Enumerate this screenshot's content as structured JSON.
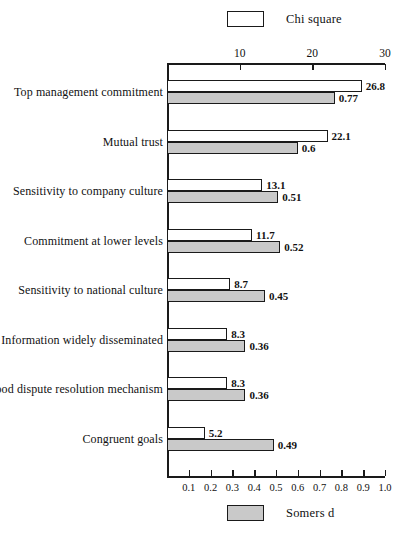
{
  "legend": {
    "top": {
      "label": "Chi square",
      "swatch": "white",
      "color": "#ffffff"
    },
    "bottom": {
      "label": "Somers d",
      "swatch": "gray",
      "color": "#c9c9c9"
    }
  },
  "axes": {
    "top": {
      "name": "Chi square",
      "ticks": [
        "10",
        "20",
        "30"
      ],
      "min": 0,
      "max": 30
    },
    "bottom": {
      "name": "Somers d",
      "ticks": [
        "0.1",
        "0.2",
        "0.3",
        "0.4",
        "0.5",
        "0.6",
        "0.7",
        "0.8",
        "0.9",
        "1.0"
      ],
      "min": 0,
      "max": 1.0
    }
  },
  "chart_data": {
    "type": "bar",
    "title": "",
    "orientation": "horizontal",
    "grid": false,
    "legend_position": "top and bottom center",
    "xlabel": "",
    "ylabel": "",
    "categories": [
      "Top management commitment",
      "Mutual trust",
      "Sensitivity to company culture",
      "Commitment at lower levels",
      "Sensitivity to national culture",
      "Information widely disseminated",
      "Good dispute resolution mechanism",
      "Congruent goals"
    ],
    "series": [
      {
        "name": "Chi square",
        "axis": "top",
        "color": "#ffffff",
        "xlim": [
          0,
          30
        ],
        "values": [
          26.8,
          22.1,
          13.1,
          11.7,
          8.7,
          8.3,
          8.3,
          5.2
        ],
        "labels": [
          "26.8",
          "22.1",
          "13.1",
          "11.7",
          "8.7",
          "8.3",
          "8.3",
          "5.2"
        ]
      },
      {
        "name": "Somers d",
        "axis": "bottom",
        "color": "#c9c9c9",
        "xlim": [
          0,
          1.0
        ],
        "values": [
          0.77,
          0.6,
          0.51,
          0.52,
          0.45,
          0.36,
          0.36,
          0.49
        ],
        "labels": [
          "0.77",
          "0.6",
          "0.51",
          "0.52",
          "0.45",
          "0.36",
          "0.36",
          "0.49"
        ]
      }
    ]
  }
}
